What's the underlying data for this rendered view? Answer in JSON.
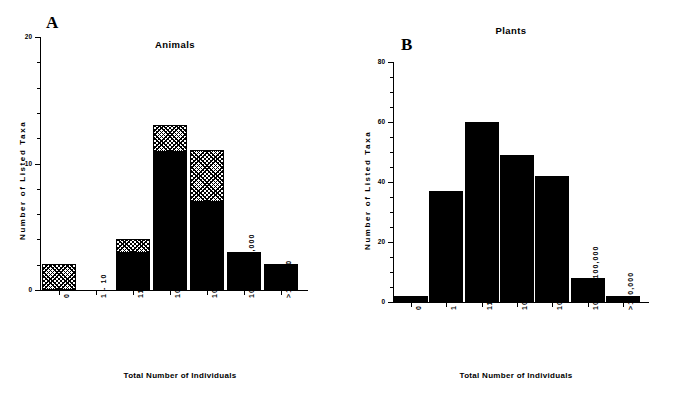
{
  "figure": {
    "panels": [
      {
        "letter": "A",
        "title": "Animals",
        "ylabel": "Number of Listed Taxa",
        "xlabel": "Total Number of Individuals"
      },
      {
        "letter": "B",
        "title": "Plants",
        "ylabel": "Number of Listed Taxa",
        "xlabel": "Total Number of Individuals"
      }
    ]
  },
  "chart_data": [
    {
      "type": "bar",
      "title": "Animals",
      "panel_label": "A",
      "xlabel": "Total Number of Individuals",
      "ylabel": "Number of Listed Taxa",
      "ylim": [
        0,
        20
      ],
      "yticks": [
        0,
        10,
        20
      ],
      "ytick_labels": [
        "0",
        "10",
        "20"
      ],
      "yminor_step": 2,
      "grid": false,
      "legend": "none",
      "stacked": true,
      "categories": [
        "0",
        "1 - 10",
        "11 - 100",
        "101-1000",
        "1001-10,000",
        "10,001-100,000",
        ">100,000"
      ],
      "series": [
        {
          "name": "solid",
          "fill": "solid-black",
          "values": [
            0,
            0,
            3,
            11,
            7,
            3,
            2
          ]
        },
        {
          "name": "hatched",
          "fill": "cross-hatch",
          "values": [
            2,
            0,
            1,
            2,
            4,
            0,
            0
          ]
        }
      ],
      "totals": [
        2,
        0,
        4,
        13,
        11,
        3,
        2
      ]
    },
    {
      "type": "bar",
      "title": "Plants",
      "panel_label": "B",
      "xlabel": "Total Number of Individuals",
      "ylabel": "Number of Listed Taxa",
      "ylim": [
        0,
        80
      ],
      "yticks": [
        0,
        20,
        40,
        60,
        80
      ],
      "ytick_labels": [
        "0",
        "20",
        "40",
        "60",
        "80"
      ],
      "yminor_step": 5,
      "grid": false,
      "legend": "none",
      "stacked": false,
      "categories": [
        "0",
        "1 - 10",
        "11 - 100",
        "101-1000",
        "1001-10,000",
        "10,001-100,000",
        ">100,000"
      ],
      "series": [
        {
          "name": "solid",
          "fill": "solid-black",
          "values": [
            2,
            37,
            60,
            49,
            42,
            8,
            2
          ]
        }
      ],
      "totals": [
        2,
        37,
        60,
        49,
        42,
        8,
        2
      ]
    }
  ],
  "colors": {
    "axis": "#000000",
    "bar_solid": "#000000",
    "bar_hatch_line": "#000000",
    "background": "#ffffff"
  }
}
